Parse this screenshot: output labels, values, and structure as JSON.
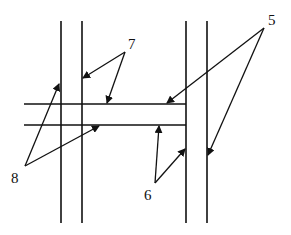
{
  "diagram": {
    "type": "structural schematic with numbered callouts",
    "stroke_color": "#111111",
    "background": "#ffffff",
    "labels": [
      {
        "id": "label-5",
        "text": "5",
        "x": 268,
        "y": 13
      },
      {
        "id": "label-7",
        "text": "7",
        "x": 128,
        "y": 37
      },
      {
        "id": "label-8",
        "text": "8",
        "x": 11,
        "y": 171
      },
      {
        "id": "label-6",
        "text": "6",
        "x": 144,
        "y": 188
      }
    ],
    "elements": {
      "left_vertical_pair": [
        61,
        82
      ],
      "right_vertical_pair": [
        186,
        207
      ],
      "horizontal_pair": [
        104,
        125
      ]
    }
  }
}
